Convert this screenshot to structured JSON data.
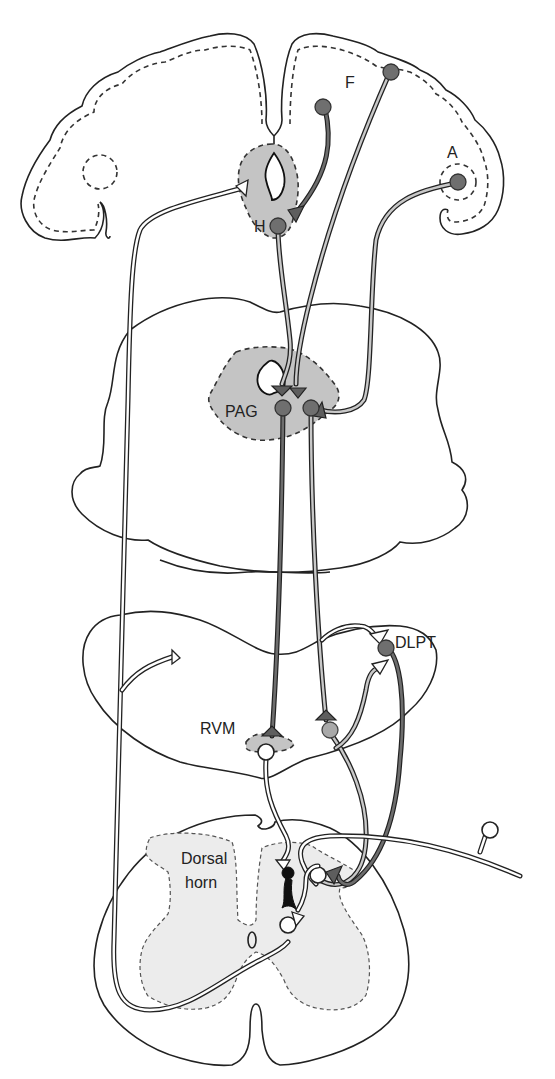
{
  "figure": {
    "colors": {
      "background": "#ffffff",
      "outline": "#222222",
      "nucleus_fill": "#c4c4c4",
      "grey_matter_fill": "#ececec",
      "dark_neuron": "#6f6f6f",
      "mid_neuron": "#a9a9a9",
      "light_axon": "#c8c8c8",
      "white_neuron": "#ffffff",
      "interneuron": "#111111"
    }
  },
  "labels": {
    "frontal": "F",
    "amygdala": "A",
    "hypothalamus": "H",
    "pag": "PAG",
    "dlpt": "DLPT",
    "rvm": "RVM",
    "dorsal_horn_line1": "Dorsal",
    "dorsal_horn_line2": "horn",
    "central_canal": "0"
  },
  "structures": [
    {
      "id": "cerebral-hemispheres",
      "name": "Forebrain (coronal section)"
    },
    {
      "id": "midbrain",
      "name": "Midbrain section with PAG"
    },
    {
      "id": "medulla-pons",
      "name": "Pons/medulla section with RVM and DLPT"
    },
    {
      "id": "spinal-cord",
      "name": "Spinal cord section with dorsal horn"
    }
  ]
}
